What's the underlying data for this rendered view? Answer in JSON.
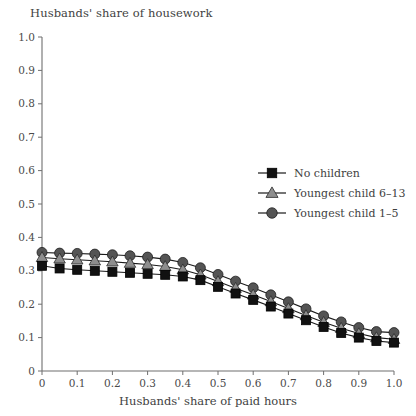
{
  "chart_data": {
    "type": "line",
    "title": "Husbands' share of housework",
    "xlabel": "Husbands' share of paid hours",
    "ylabel": "",
    "xlim": [
      0,
      1.0
    ],
    "ylim": [
      0,
      1.0
    ],
    "xticks": [
      "0",
      "0.1",
      "0.2",
      "0.3",
      "0.4",
      "0.5",
      "0.6",
      "0.7",
      "0.8",
      "0.9",
      "1.0"
    ],
    "yticks": [
      "0",
      "0.1",
      "0.2",
      "0.3",
      "0.4",
      "0.5",
      "0.6",
      "0.7",
      "0.8",
      "0.9",
      "1.0"
    ],
    "grid": false,
    "legend_position": "upper right",
    "x": [
      0,
      0.05,
      0.1,
      0.15,
      0.2,
      0.25,
      0.3,
      0.35,
      0.4,
      0.45,
      0.5,
      0.55,
      0.6,
      0.65,
      0.7,
      0.75,
      0.8,
      0.85,
      0.9,
      0.95,
      1.0
    ],
    "series": [
      {
        "name": "No children",
        "marker": "square",
        "color": "#111111",
        "values": [
          0.315,
          0.307,
          0.303,
          0.3,
          0.297,
          0.294,
          0.291,
          0.288,
          0.283,
          0.272,
          0.252,
          0.232,
          0.213,
          0.193,
          0.172,
          0.152,
          0.132,
          0.114,
          0.1,
          0.09,
          0.085
        ]
      },
      {
        "name": "Youngest child 6–13",
        "marker": "triangle",
        "color": "#8e8e8e",
        "values": [
          0.34,
          0.336,
          0.333,
          0.33,
          0.327,
          0.323,
          0.319,
          0.313,
          0.303,
          0.288,
          0.268,
          0.248,
          0.228,
          0.208,
          0.187,
          0.166,
          0.146,
          0.128,
          0.112,
          0.1,
          0.095
        ]
      },
      {
        "name": "Youngest child 1–5",
        "marker": "circle",
        "color": "#545454",
        "values": [
          0.355,
          0.353,
          0.352,
          0.35,
          0.348,
          0.345,
          0.341,
          0.335,
          0.325,
          0.309,
          0.289,
          0.269,
          0.249,
          0.228,
          0.207,
          0.186,
          0.165,
          0.147,
          0.13,
          0.118,
          0.115
        ]
      }
    ]
  },
  "legend": {
    "items": [
      {
        "label": "No children"
      },
      {
        "label": "Youngest child 6–13"
      },
      {
        "label": "Youngest child 1–5"
      }
    ]
  }
}
